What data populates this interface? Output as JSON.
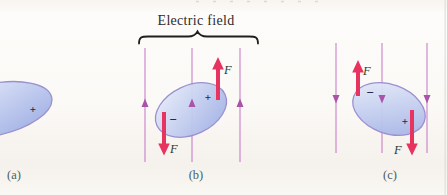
{
  "figure": {
    "title": "Electric field",
    "panels": [
      {
        "label": "(a)",
        "field_direction": "none",
        "charges": [
          {
            "sign": "+"
          }
        ]
      },
      {
        "label": "(b)",
        "field_direction": "up",
        "charges": [
          {
            "sign": "+"
          },
          {
            "sign": "−"
          }
        ],
        "forces": [
          {
            "label": "F",
            "direction": "up",
            "on": "+"
          },
          {
            "label": "F",
            "direction": "down",
            "on": "−"
          }
        ]
      },
      {
        "label": "(c)",
        "field_direction": "down",
        "charges": [
          {
            "sign": "−"
          },
          {
            "sign": "+"
          }
        ],
        "forces": [
          {
            "label": "F",
            "direction": "up",
            "on": "−"
          },
          {
            "label": "F",
            "direction": "down",
            "on": "+"
          }
        ]
      }
    ]
  },
  "colors": {
    "field_line": "#c069be",
    "field_arrowhead": "#a953a9",
    "force_arrow": "#e73360",
    "molecule_fill_light": "#eaeffb",
    "molecule_fill_dark": "#a3b2e5",
    "molecule_outline": "#9b90cf",
    "charge_sign": "#23234a",
    "force_label": "#2c3a31",
    "panel_label": "#4a6159",
    "field_label": "#2e2b28",
    "brace": "#1f1f1f"
  }
}
